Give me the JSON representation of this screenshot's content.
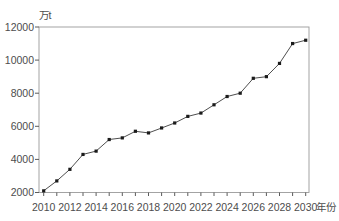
{
  "chart_data": {
    "type": "line",
    "title": "",
    "ylabel": "万t",
    "xlabel": "年份",
    "x": [
      2010,
      2011,
      2012,
      2013,
      2014,
      2015,
      2016,
      2017,
      2018,
      2019,
      2020,
      2021,
      2022,
      2023,
      2024,
      2025,
      2026,
      2027,
      2028,
      2029,
      2030
    ],
    "values": [
      2100,
      2700,
      3400,
      4300,
      4500,
      5200,
      5300,
      5700,
      5600,
      5900,
      6200,
      6600,
      6800,
      7300,
      7800,
      8000,
      8900,
      9000,
      9800,
      11000,
      11200
    ],
    "ylim": [
      2000,
      12000
    ],
    "yticks": [
      2000,
      4000,
      6000,
      8000,
      10000,
      12000
    ],
    "xtick_step": 1,
    "xtick_labels": [
      "2010",
      "2012",
      "2014",
      "2016",
      "2018",
      "2020",
      "2022",
      "2024",
      "2026",
      "2028",
      "2030"
    ],
    "grid": false,
    "legend": null,
    "marker": "square",
    "colors": {
      "line": "#3a3a3a",
      "marker": "#1b1b1b",
      "frame": "#9a9a9a",
      "tick": "#5a5a5a",
      "text": "#4d4d4d",
      "background": "#ffffff"
    }
  }
}
